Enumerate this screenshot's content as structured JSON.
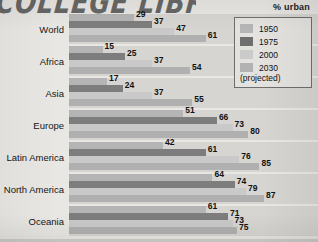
{
  "title": "% urban",
  "stamp_text": "COLLEGE LIBRARY",
  "legend": {
    "items": [
      {
        "label": "1950",
        "color": "#b5b5b5"
      },
      {
        "label": "1975",
        "color": "#6f6f6f"
      },
      {
        "label": "2000",
        "color": "#cacaca"
      },
      {
        "label": "2030",
        "color": "#b2b2b2"
      }
    ],
    "note": "(projected)"
  },
  "chart_data": {
    "type": "bar",
    "orientation": "horizontal",
    "title": "% urban",
    "xlabel": "",
    "ylabel": "",
    "xlim": [
      0,
      100
    ],
    "grid": false,
    "legend_position": "top-right",
    "categories": [
      "World",
      "Africa",
      "Asia",
      "Europe",
      "Latin America",
      "North America",
      "Oceania"
    ],
    "series": [
      {
        "name": "1950",
        "color": "#b5b5b5",
        "values": [
          29,
          15,
          17,
          51,
          42,
          64,
          61
        ]
      },
      {
        "name": "1975",
        "color": "#6f6f6f",
        "values": [
          37,
          25,
          24,
          66,
          61,
          74,
          71
        ]
      },
      {
        "name": "2000",
        "color": "#cacaca",
        "values": [
          47,
          37,
          37,
          73,
          76,
          79,
          73
        ]
      },
      {
        "name": "2030 (projected)",
        "color": "#b2b2b2",
        "values": [
          61,
          54,
          55,
          80,
          85,
          87,
          75
        ]
      }
    ]
  },
  "rows": [
    {
      "label": "World",
      "values": [
        29,
        37,
        47,
        61
      ]
    },
    {
      "label": "Africa",
      "values": [
        15,
        25,
        37,
        54
      ]
    },
    {
      "label": "Asia",
      "values": [
        17,
        24,
        37,
        55
      ]
    },
    {
      "label": "Europe",
      "values": [
        51,
        66,
        73,
        80
      ]
    },
    {
      "label": "Latin America",
      "values": [
        42,
        61,
        76,
        85
      ]
    },
    {
      "label": "North America",
      "values": [
        64,
        74,
        79,
        87
      ]
    },
    {
      "label": "Oceania",
      "values": [
        61,
        71,
        73,
        75
      ]
    }
  ]
}
